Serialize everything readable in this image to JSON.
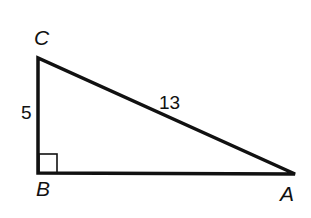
{
  "diagram": {
    "type": "right-triangle",
    "stroke_color": "#111111",
    "background": "#ffffff",
    "vertices": {
      "A": {
        "label": "A",
        "x": 295,
        "y": 174
      },
      "B": {
        "label": "B",
        "x": 38,
        "y": 173
      },
      "C": {
        "label": "C",
        "x": 38,
        "y": 58
      }
    },
    "sides": {
      "BC": {
        "label": "5"
      },
      "CA": {
        "label": "13"
      }
    },
    "right_angle_at": "B"
  }
}
